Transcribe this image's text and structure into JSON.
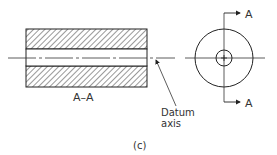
{
  "diagram": {
    "section_label": "A–A",
    "datum_label_line1": "Datum",
    "datum_label_line2": "axis",
    "caption": "(c)",
    "cut_plane_label_top": "A",
    "cut_plane_label_bottom": "A",
    "stroke_color": "#222222",
    "hatch_color": "#444444"
  }
}
